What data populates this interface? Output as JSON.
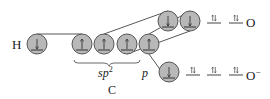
{
  "diagram": {
    "title": "",
    "atoms": {
      "hydrogen": {
        "label": "H"
      },
      "carbon": {
        "label": "C",
        "hybrid_label": "sp",
        "hybrid_superscript": "2",
        "p_label": "p"
      },
      "oxygen_top": {
        "label": "O"
      },
      "oxygen_bottom": {
        "label": "O",
        "charge": "−"
      }
    },
    "orbitals": {
      "hydrogen": [
        {
          "electrons": "down"
        }
      ],
      "carbon_sp2": [
        {
          "electrons": "up"
        },
        {
          "electrons": "up"
        },
        {
          "electrons": "up"
        }
      ],
      "carbon_p": [
        {
          "electrons": "up"
        }
      ],
      "oxygen_top_bonding": [
        {
          "electrons": "down"
        },
        {
          "electrons": "down"
        }
      ],
      "oxygen_top_lone_pairs": [
        {
          "electrons": "pair"
        },
        {
          "electrons": "pair"
        }
      ],
      "oxygen_bottom_bonding": [
        {
          "electrons": "down"
        }
      ],
      "oxygen_bottom_lone_pairs": [
        {
          "electrons": "pair"
        },
        {
          "electrons": "pair"
        },
        {
          "electrons": "pair"
        }
      ]
    },
    "colors": {
      "orbital_fill": "#b8b8b8",
      "orbital_stroke": "#555555",
      "line": "#444444",
      "text": "#222222"
    }
  }
}
